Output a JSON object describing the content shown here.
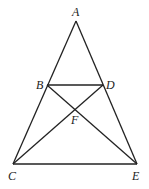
{
  "diagram": {
    "type": "geometry",
    "points": {
      "A": {
        "label": "A",
        "x": 76,
        "y": 21
      },
      "B": {
        "label": "B",
        "x": 47,
        "y": 85
      },
      "D": {
        "label": "D",
        "x": 103,
        "y": 85
      },
      "F": {
        "label": "F",
        "x": 75,
        "y": 109
      },
      "C": {
        "label": "C",
        "x": 13,
        "y": 164
      },
      "E": {
        "label": "E",
        "x": 137,
        "y": 164
      }
    },
    "segments": [
      "AC",
      "AE",
      "CE",
      "BD",
      "BE",
      "CD"
    ]
  }
}
